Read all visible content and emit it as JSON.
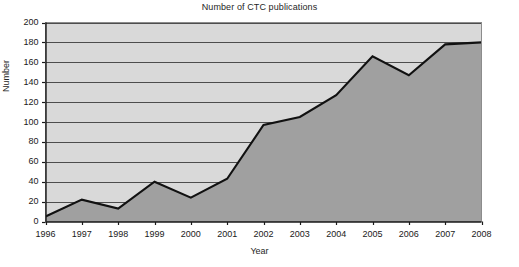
{
  "chart_data": {
    "type": "area",
    "title": "Number of CTC publications",
    "xlabel": "Year",
    "ylabel": "Number",
    "categories": [
      "1996",
      "1997",
      "1998",
      "1999",
      "2000",
      "2001",
      "2002",
      "2003",
      "2004",
      "2005",
      "2006",
      "2007",
      "2008"
    ],
    "values": [
      5,
      22,
      13,
      40,
      24,
      43,
      97,
      105,
      127,
      166,
      147,
      178,
      180
    ],
    "series": [
      {
        "name": "Number of CTC publications",
        "values": [
          5,
          22,
          13,
          40,
          24,
          43,
          97,
          105,
          127,
          166,
          147,
          178,
          180
        ]
      }
    ],
    "ylim": [
      0,
      200
    ],
    "y_ticks": [
      0,
      20,
      40,
      60,
      80,
      100,
      120,
      140,
      160,
      180,
      200
    ],
    "y_tick_labels": [
      "0",
      "20",
      "40",
      "60",
      "80",
      "100",
      "120",
      "140",
      "160",
      "180",
      "200"
    ],
    "x_tick_labels": [
      "1996",
      "1997",
      "1998",
      "1999",
      "2000",
      "2001",
      "2002",
      "2003",
      "2004",
      "2005",
      "2006",
      "2007",
      "2008"
    ],
    "grid": true,
    "grid_axis": "y",
    "legend": false,
    "legend_position": "none",
    "colors": {
      "plot_background": "#d9d9d9",
      "area_fill": "#a0a0a0",
      "line": "#111111",
      "axis": "#1a1a1a",
      "gridline": "#4d4d4d",
      "page_background": "#ffffff",
      "text": "#1a1a1a"
    }
  }
}
